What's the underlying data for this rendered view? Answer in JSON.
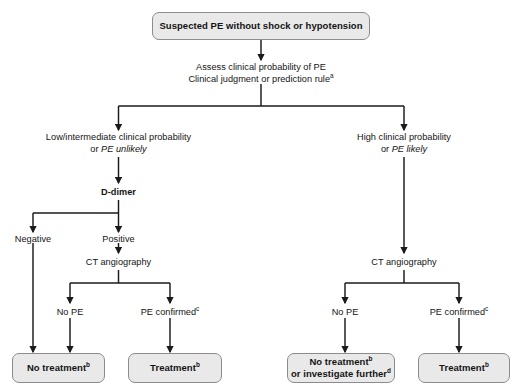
{
  "diagram": {
    "line_color": "#1a1a1a",
    "box_fill": "#e9e9e9",
    "box_border": "#8c8c8c",
    "text_color": "#141414"
  },
  "nodes": {
    "top": {
      "text": "Suspected PE without shock or hypotension"
    },
    "assess": {
      "line1": "Assess clinical probability of PE",
      "line2": "Clinical judgment or prediction rule",
      "line2_sup": "a"
    },
    "left_branch": {
      "line1": "Low/intermediate clinical probability",
      "line2_prefix": "or ",
      "line2_italic": "PE unlikely"
    },
    "right_branch": {
      "line1": "High clinical probability",
      "line2_prefix": "or ",
      "line2_italic": "PE likely"
    },
    "ddimer": {
      "text": "D-dimer"
    },
    "negative": {
      "text": "Negative"
    },
    "positive": {
      "text": "Positive"
    },
    "ct_left": {
      "text": "CT angiography"
    },
    "ct_right": {
      "text": "CT angiography"
    },
    "no_pe_left": {
      "text": "No PE"
    },
    "pe_confirmed_left": {
      "text": "PE confirmed",
      "sup": "c"
    },
    "no_pe_right": {
      "text": "No PE"
    },
    "pe_confirmed_right": {
      "text": "PE confirmed",
      "sup": "c"
    }
  },
  "outcomes": [
    {
      "id": "no-treatment-left",
      "line1": "No treatment",
      "line1_sup": "b",
      "line2": "",
      "line2_sup": ""
    },
    {
      "id": "treatment-left",
      "line1": "Treatment",
      "line1_sup": "b",
      "line2": "",
      "line2_sup": ""
    },
    {
      "id": "no-treatment-right",
      "line1": "No treatment",
      "line1_sup": "b",
      "line2": "or investigate further",
      "line2_sup": "d"
    },
    {
      "id": "treatment-right",
      "line1": "Treatment",
      "line1_sup": "b",
      "line2": "",
      "line2_sup": ""
    }
  ]
}
